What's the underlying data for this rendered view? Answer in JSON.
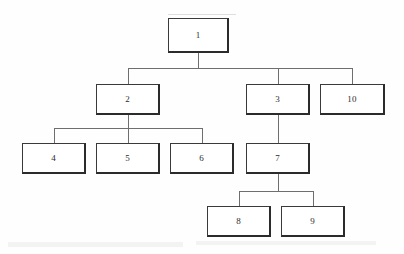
{
  "diagram": {
    "type": "tree-hierarchy",
    "title": "",
    "background_color": "#fefefe",
    "node_border_color": "#3a3a3a",
    "node_fill_color": "#ffffff",
    "edge_color": "#6e6e6e",
    "text_color": "#2c2c2c",
    "nodes": [
      {
        "id": "n1",
        "label": "1",
        "x": 168,
        "y": 18,
        "w": 61,
        "h": 35,
        "level": 0
      },
      {
        "id": "n2",
        "label": "2",
        "x": 96,
        "y": 84,
        "w": 64,
        "h": 31,
        "level": 1
      },
      {
        "id": "n3",
        "label": "3",
        "x": 246,
        "y": 84,
        "w": 64,
        "h": 31,
        "level": 1
      },
      {
        "id": "n10",
        "label": "10",
        "x": 320,
        "y": 84,
        "w": 65,
        "h": 31,
        "level": 1
      },
      {
        "id": "n4",
        "label": "4",
        "x": 22,
        "y": 143,
        "w": 64,
        "h": 31,
        "level": 2
      },
      {
        "id": "n5",
        "label": "5",
        "x": 96,
        "y": 143,
        "w": 64,
        "h": 31,
        "level": 2
      },
      {
        "id": "n6",
        "label": "6",
        "x": 170,
        "y": 143,
        "w": 64,
        "h": 31,
        "level": 2
      },
      {
        "id": "n7",
        "label": "7",
        "x": 246,
        "y": 143,
        "w": 64,
        "h": 31,
        "level": 2
      },
      {
        "id": "n8",
        "label": "8",
        "x": 207,
        "y": 206,
        "w": 64,
        "h": 31,
        "level": 3
      },
      {
        "id": "n9",
        "label": "9",
        "x": 281,
        "y": 206,
        "w": 64,
        "h": 31,
        "level": 3
      }
    ],
    "edges": [
      {
        "from": "1",
        "to": "2"
      },
      {
        "from": "1",
        "to": "3"
      },
      {
        "from": "1",
        "to": "10"
      },
      {
        "from": "2",
        "to": "4"
      },
      {
        "from": "2",
        "to": "5"
      },
      {
        "from": "2",
        "to": "6"
      },
      {
        "from": "3",
        "to": "7"
      },
      {
        "from": "7",
        "to": "8"
      },
      {
        "from": "7",
        "to": "9"
      }
    ],
    "connectors": [
      {
        "name": "root-drop",
        "orient": "v",
        "x": 198,
        "y": 53,
        "len": 15
      },
      {
        "name": "root-bus",
        "orient": "h",
        "x": 128,
        "y": 68,
        "len": 225
      },
      {
        "name": "bus-to-2",
        "orient": "v",
        "x": 128,
        "y": 68,
        "len": 16
      },
      {
        "name": "bus-to-3",
        "orient": "v",
        "x": 278,
        "y": 68,
        "len": 16
      },
      {
        "name": "bus-to-10",
        "orient": "v",
        "x": 352,
        "y": 68,
        "len": 16
      },
      {
        "name": "node2-drop",
        "orient": "v",
        "x": 128,
        "y": 115,
        "len": 13
      },
      {
        "name": "node2-bus",
        "orient": "h",
        "x": 54,
        "y": 128,
        "len": 148
      },
      {
        "name": "bus-to-4",
        "orient": "v",
        "x": 54,
        "y": 128,
        "len": 15
      },
      {
        "name": "bus-to-5",
        "orient": "v",
        "x": 128,
        "y": 128,
        "len": 15
      },
      {
        "name": "bus-to-6",
        "orient": "v",
        "x": 202,
        "y": 128,
        "len": 15
      },
      {
        "name": "node3-to-node7",
        "orient": "v",
        "x": 278,
        "y": 115,
        "len": 28
      },
      {
        "name": "node7-drop",
        "orient": "v",
        "x": 278,
        "y": 174,
        "len": 17
      },
      {
        "name": "node7-bus",
        "orient": "h",
        "x": 239,
        "y": 191,
        "len": 75
      },
      {
        "name": "bus-to-8",
        "orient": "v",
        "x": 239,
        "y": 191,
        "len": 15
      },
      {
        "name": "bus-to-9",
        "orient": "v",
        "x": 313,
        "y": 191,
        "len": 15
      }
    ],
    "artifacts": [
      {
        "name": "bottom-bleed-band",
        "x": 8,
        "y": 242,
        "w": 175,
        "h": 5
      },
      {
        "name": "bottom-bleed-band-right",
        "x": 196,
        "y": 241,
        "w": 180,
        "h": 4
      },
      {
        "name": "top-faint-line",
        "x": 168,
        "y": 14,
        "w": 68,
        "h": 1
      }
    ]
  }
}
